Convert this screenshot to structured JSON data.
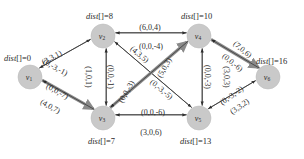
{
  "diagram": {
    "type": "directed-graph",
    "colors": {
      "node_fill": "#c9c9c9",
      "node_stroke": "#bdbdbd",
      "edge": "#3a3a3a",
      "highlight_edge": "#8a8a8a",
      "text": "#2b2b2b",
      "background": "#ffffff"
    },
    "nodes": [
      {
        "id": "v1",
        "label": "v",
        "sub": "1",
        "x": 30,
        "y": 77,
        "dist": "dist[]=0",
        "dist_x": 4,
        "dist_y": 61
      },
      {
        "id": "v2",
        "label": "v",
        "sub": "2",
        "x": 103,
        "y": 36,
        "dist": "dist[]=8",
        "dist_x": 86,
        "dist_y": 19
      },
      {
        "id": "v3",
        "label": "v",
        "sub": "3",
        "x": 103,
        "y": 118,
        "dist": "dist[]=7",
        "dist_x": 88,
        "dist_y": 144
      },
      {
        "id": "v4",
        "label": "v",
        "sub": "4",
        "x": 199,
        "y": 36,
        "dist": "dist[]=10",
        "dist_x": 181,
        "dist_y": 19
      },
      {
        "id": "v5",
        "label": "v",
        "sub": "5",
        "x": 199,
        "y": 118,
        "dist": "dist[]=13",
        "dist_x": 180,
        "dist_y": 144
      },
      {
        "id": "v6",
        "label": "v",
        "sub": "6",
        "x": 268,
        "y": 77,
        "dist": "dist[]=16",
        "dist_x": 256,
        "dist_y": 64
      }
    ],
    "edges": [
      {
        "from": "v1",
        "to": "v2",
        "label": "(3,3,1)",
        "highlight": false
      },
      {
        "from": "v2",
        "to": "v1",
        "label": "(0,-3,-1)",
        "highlight": false
      },
      {
        "from": "v1",
        "to": "v3",
        "label": "(4,0,7)",
        "highlight": true
      },
      {
        "from": "v3",
        "to": "v1",
        "label": "(0,0,-7)",
        "highlight": false
      },
      {
        "from": "v2",
        "to": "v3",
        "label": "(1,0,1)",
        "highlight": false
      },
      {
        "from": "v3",
        "to": "v2",
        "label": "(0,0,-1)",
        "highlight": false
      },
      {
        "from": "v2",
        "to": "v4",
        "label": "(6,0,4)",
        "highlight": false
      },
      {
        "from": "v4",
        "to": "v2",
        "label": "(0,0,-4)",
        "highlight": false
      },
      {
        "from": "v2",
        "to": "v5",
        "label": "(4,3,5)",
        "highlight": false
      },
      {
        "from": "v5",
        "to": "v2",
        "label": "(0,-3,-5)",
        "highlight": false
      },
      {
        "from": "v3",
        "to": "v4",
        "label": "(5,0,3)",
        "highlight": true
      },
      {
        "from": "v4",
        "to": "v3",
        "label": "(0,0,-3)",
        "highlight": false
      },
      {
        "from": "v3",
        "to": "v5",
        "label": "(3,0,6)",
        "highlight": false
      },
      {
        "from": "v5",
        "to": "v3",
        "label": "(0,0,-6)",
        "highlight": false
      },
      {
        "from": "v4",
        "to": "v5",
        "label": "(0,0,-3)",
        "highlight": false
      },
      {
        "from": "v5",
        "to": "v4",
        "label": "(3,0,3)",
        "highlight": false
      },
      {
        "from": "v4",
        "to": "v6",
        "label": "(7,0,6)",
        "highlight": true
      },
      {
        "from": "v6",
        "to": "v4",
        "label": "(0,0,-6)",
        "highlight": false
      },
      {
        "from": "v5",
        "to": "v6",
        "label": "(3,3,2)",
        "highlight": false
      },
      {
        "from": "v6",
        "to": "v5",
        "label": "(0,-3,-2)",
        "highlight": false
      }
    ],
    "edge_label_positions": [
      {
        "text_ref": 0,
        "x": 52,
        "y": 58,
        "rot": -29
      },
      {
        "text_ref": 1,
        "x": 55,
        "y": 68,
        "rot": 29
      },
      {
        "text_ref": 2,
        "x": 50,
        "y": 107,
        "rot": 29
      },
      {
        "text_ref": 3,
        "x": 57,
        "y": 92,
        "rot": 29
      },
      {
        "text_ref": 4,
        "x": 88,
        "y": 77,
        "rot": 90
      },
      {
        "text_ref": 5,
        "x": 110,
        "y": 77,
        "rot": 90
      },
      {
        "text_ref": 6,
        "x": 150,
        "y": 28,
        "rot": 0
      },
      {
        "text_ref": 7,
        "x": 151,
        "y": 47,
        "rot": 0
      },
      {
        "text_ref": 8,
        "x": 139,
        "y": 55,
        "rot": 40
      },
      {
        "text_ref": 9,
        "x": 161,
        "y": 90,
        "rot": 40
      },
      {
        "text_ref": 10,
        "x": 165,
        "y": 68,
        "rot": -60
      },
      {
        "text_ref": 11,
        "x": 127,
        "y": 92,
        "rot": -60
      },
      {
        "text_ref": 12,
        "x": 151,
        "y": 133,
        "rot": 0
      },
      {
        "text_ref": 13,
        "x": 153,
        "y": 113,
        "rot": 0
      },
      {
        "text_ref": 14,
        "x": 207,
        "y": 77,
        "rot": 90
      },
      {
        "text_ref": 15,
        "x": 226,
        "y": 77,
        "rot": 90
      },
      {
        "text_ref": 16,
        "x": 242,
        "y": 50,
        "rot": 40
      },
      {
        "text_ref": 17,
        "x": 232,
        "y": 63,
        "rot": 40
      },
      {
        "text_ref": 18,
        "x": 240,
        "y": 107,
        "rot": -35
      },
      {
        "text_ref": 19,
        "x": 232,
        "y": 96,
        "rot": -35
      }
    ]
  }
}
